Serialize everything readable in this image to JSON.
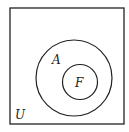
{
  "diagram": {
    "type": "venn",
    "universe": {
      "label": "U",
      "x": 10,
      "y": 8,
      "width": 114,
      "height": 116
    },
    "sets": [
      {
        "label": "A",
        "cx": 74,
        "cy": 78,
        "r": 38,
        "label_x": 52,
        "label_y": 64
      },
      {
        "label": "F",
        "cx": 80,
        "cy": 82,
        "r": 17.5,
        "label_x": 75,
        "label_y": 87
      }
    ],
    "universe_label_pos": {
      "x": 15,
      "y": 119
    },
    "relation": "F is a subset of A, A is a subset of U",
    "stroke_color": "#222222"
  }
}
